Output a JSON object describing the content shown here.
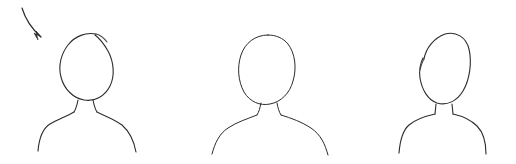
{
  "canvas": {
    "width": 516,
    "height": 164,
    "background_color": "#ffffff",
    "ink_color": "#2e2b2e",
    "ink_color_soft": "#4a464b",
    "medium": "hand-drawn pencil sketch",
    "content_description": "Three hand-drawn bust silhouettes (head, neck and shoulders) in a row, with a curved arrow pointing at the first one"
  },
  "annotation_arrow": {
    "name": "pointer-arrow",
    "start": [
      22,
      8
    ],
    "end": [
      42,
      38
    ],
    "curve_control": [
      26,
      28
    ],
    "path": "M22,8 C25,18 32,29 41,37",
    "stroke_width": 1.2,
    "head_points": "41,37 34,33 38,40 36,31",
    "points_at": "figure-1-head"
  },
  "figures": [
    {
      "id": "figure-1",
      "name": "bust-figure-1",
      "center_x": 86,
      "head": {
        "name": "head-outline",
        "bounds": [
          60,
          33,
          113,
          101
        ],
        "has_stroke_gap": true,
        "gap_location": "top-right",
        "path": "M96,34 C86,32 75,36 68,45 C61,54 58,66 61,77 C64,89 73,98 84,100 C95,102 105,96 110,86 C115,76 114,62 108,51 C104,44 99,38 95,35",
        "gap_path": "M96,34 C100,35 104,38 107,42",
        "stroke_width": 1.1
      },
      "neck": {
        "name": "neck-outline",
        "left_path": "M78,100 C77,105 76,109 74,112",
        "right_path": "M93,100 C94,105 95,109 97,112",
        "stroke_width": 1.1
      },
      "shoulders": {
        "name": "shoulders-outline",
        "left_path": "M74,112 C66,117 58,119 50,124 C42,129 39,139 38,151",
        "right_path": "M97,112 C105,116 114,119 122,125 C130,132 134,141 136,152",
        "stroke_width": 1.1,
        "left_end": [
          38,
          151
        ],
        "right_end": [
          136,
          152
        ]
      }
    },
    {
      "id": "figure-2",
      "name": "bust-figure-2",
      "center_x": 268,
      "head": {
        "name": "head-outline",
        "bounds": [
          240,
          34,
          296,
          104
        ],
        "has_stroke_gap": false,
        "gap_location": null,
        "path": "M268,35 C255,35 245,43 241,55 C237,67 238,81 244,92 C250,102 260,106 270,104 C281,102 290,93 293,81 C297,68 295,53 288,44 C283,38 276,35 268,35 Z",
        "gap_path": "",
        "stroke_width": 1.0
      },
      "neck": {
        "name": "neck-outline",
        "left_path": "M261,103 C260,108 259,112 257,115",
        "right_path": "M277,103 C278,108 279,112 281,115",
        "stroke_width": 1.0
      },
      "shoulders": {
        "name": "shoulders-outline",
        "left_path": "M257,115 C247,119 237,122 228,128 C219,134 215,143 212,154",
        "right_path": "M281,115 C291,118 302,122 311,128 C321,135 325,144 328,155",
        "stroke_width": 1.0,
        "left_end": [
          212,
          154
        ],
        "right_end": [
          328,
          155
        ]
      }
    },
    {
      "id": "figure-3",
      "name": "bust-figure-3",
      "center_x": 443,
      "head": {
        "name": "head-outline",
        "bounds": [
          418,
          33,
          470,
          106
        ],
        "has_stroke_gap": true,
        "gap_location": "upper-left",
        "path": "M424,59 C426,48 434,38 445,34 C456,31 466,37 469,49 C472,62 470,79 463,91 C457,101 447,106 437,103 C428,100 422,90 420,78 C419,71 420,64 423,58",
        "gap_path": "M424,59 C422,62 421,66 420,70",
        "stroke_width": 1.1
      },
      "neck": {
        "name": "neck-outline",
        "left_path": "M436,104 L435,114",
        "right_path": "M452,104 L453,114",
        "stroke_width": 1.1,
        "shape": "squared"
      },
      "shoulders": {
        "name": "shoulders-outline",
        "left_path": "M435,114 C426,116 416,119 409,125 C402,131 400,141 399,153",
        "right_path": "M453,114 C462,116 471,120 477,126 C484,133 486,143 486,154",
        "stroke_width": 1.1,
        "left_end": [
          399,
          153
        ],
        "right_end": [
          486,
          154
        ]
      }
    }
  ]
}
